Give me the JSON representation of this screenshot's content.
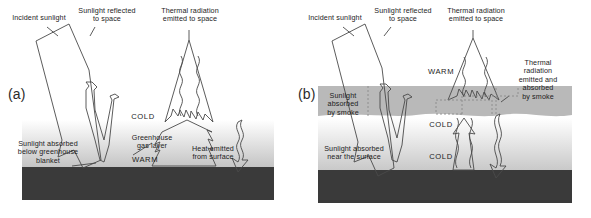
{
  "figure": {
    "background_color": "#ffffff",
    "width": 591,
    "height": 218
  },
  "colors": {
    "ground": "#3a3a3a",
    "smoke_layer": "#b9b9b9",
    "greenhouse_gradient_top": "#ffffff",
    "greenhouse_gradient_bottom": "#c8c8c8",
    "outline": "#4a4a4a",
    "text": "#1c1c1c",
    "dashed_outline": "#8a8a8a"
  },
  "panels": [
    {
      "id": "a",
      "label": "(a)",
      "labels": {
        "incident_sunlight": "Incident sunlight",
        "sunlight_reflected": "Sunlight reflected\nto space",
        "thermal_radiation": "Thermal radiation\nemitted to space",
        "cold": "COLD",
        "greenhouse_gas_layer": "Greenhouse\ngas layer",
        "warm": "WARM",
        "heat_emitted": "Heat emitted\nfrom surface",
        "sunlight_absorbed": "Sunlight absorbed\nbelow greenhouse\nblanket"
      }
    },
    {
      "id": "b",
      "label": "(b)",
      "labels": {
        "incident_sunlight": "Incident sunlight",
        "sunlight_reflected": "Sunlight reflected\nto space",
        "thermal_radiation": "Thermal radiation\nemitted to space",
        "warm": "WARM",
        "cold_upper": "COLD",
        "cold_lower": "COLD",
        "thermal_absorbed_smoke": "Thermal\nradiation\nemitted and\nabsorbed\nby smoke",
        "sunlight_absorbed_smoke": "Sunlight\nabsorbed\nby smoke",
        "sunlight_absorbed_surface": "Sunlight absorbed\nnear the surface"
      }
    }
  ]
}
